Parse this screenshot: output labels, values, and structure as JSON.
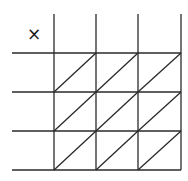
{
  "diagram": {
    "title": "",
    "operator_symbol": "×",
    "type": "lattice-multiplication-grid",
    "rows": 3,
    "cols": 3,
    "line_color": "#2a2a2a",
    "background": "#ffffff",
    "geometry": {
      "col_x": [
        54,
        96,
        138,
        181
      ],
      "row_y": [
        53,
        92,
        131,
        170
      ],
      "top_y": 14,
      "left_x": 12
    },
    "cells": [
      [
        "",
        "",
        ""
      ],
      [
        "",
        "",
        ""
      ],
      [
        "",
        "",
        ""
      ]
    ],
    "top_labels": [
      "",
      "",
      ""
    ],
    "left_labels": [
      "",
      "",
      ""
    ]
  }
}
